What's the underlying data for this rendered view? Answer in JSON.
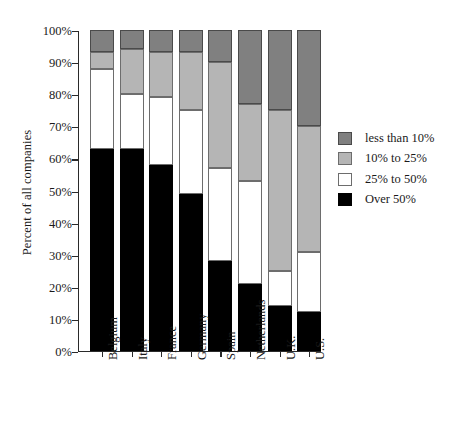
{
  "chart_data": {
    "type": "bar",
    "subtype": "stacked-bar-100-percent",
    "title": "",
    "xlabel": "",
    "ylabel": "Percent of all companies",
    "ylim": [
      0,
      100
    ],
    "ytick_labels": [
      "0%",
      "10%",
      "20%",
      "30%",
      "40%",
      "50%",
      "60%",
      "70%",
      "80%",
      "90%",
      "100%"
    ],
    "ytick_values": [
      0,
      10,
      20,
      30,
      40,
      50,
      60,
      70,
      80,
      90,
      100
    ],
    "grid": false,
    "legend_position": "right",
    "categories": [
      "Belgium",
      "Italy",
      "France",
      "Germany",
      "Spain",
      "Netherlands",
      "U.K.",
      "U.S."
    ],
    "series": [
      {
        "name": "Over 50%",
        "color": "#000000",
        "values": [
          63,
          63,
          58,
          49,
          28,
          21,
          14,
          12
        ]
      },
      {
        "name": "25% to 50%",
        "color": "#ffffff",
        "values": [
          25,
          17,
          21,
          26,
          29,
          32,
          11,
          19
        ]
      },
      {
        "name": "10% to 25%",
        "color": "#b5b5b5",
        "values": [
          5,
          14,
          14,
          18,
          33,
          24,
          50,
          39
        ]
      },
      {
        "name": "less than 10%",
        "color": "#808080",
        "values": [
          7,
          6,
          7,
          7,
          10,
          23,
          25,
          30
        ]
      }
    ],
    "legend_order_top_to_bottom": [
      "less than 10%",
      "10% to 25%",
      "25% to 50%",
      "Over 50%"
    ],
    "cumulative_tops": {
      "Belgium": {
        "over50": 63,
        "to50": 88,
        "to25": 93,
        "lt10": 100
      },
      "Italy": {
        "over50": 63,
        "to50": 80,
        "to25": 94,
        "lt10": 100
      },
      "France": {
        "over50": 58,
        "to50": 79,
        "to25": 93,
        "lt10": 100
      },
      "Germany": {
        "over50": 49,
        "to50": 75,
        "to25": 93,
        "lt10": 100
      },
      "Spain": {
        "over50": 28,
        "to50": 57,
        "to25": 90,
        "lt10": 100
      },
      "Netherlands": {
        "over50": 21,
        "to50": 53,
        "to25": 77,
        "lt10": 100
      },
      "U.K.": {
        "over50": 14,
        "to50": 25,
        "to25": 75,
        "lt10": 100
      },
      "U.S.": {
        "over50": 12,
        "to50": 31,
        "to25": 70,
        "lt10": 100
      }
    }
  }
}
